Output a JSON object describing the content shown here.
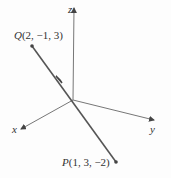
{
  "diagram": {
    "axes": {
      "x": "x",
      "y": "y",
      "z": "z"
    },
    "points": {
      "Q": {
        "name": "Q",
        "coords": "(2, −1, 3)"
      },
      "P": {
        "name": "P",
        "coords": "(1, 3, −2)"
      }
    },
    "colors": {
      "line": "#555555",
      "point": "#444444"
    }
  }
}
